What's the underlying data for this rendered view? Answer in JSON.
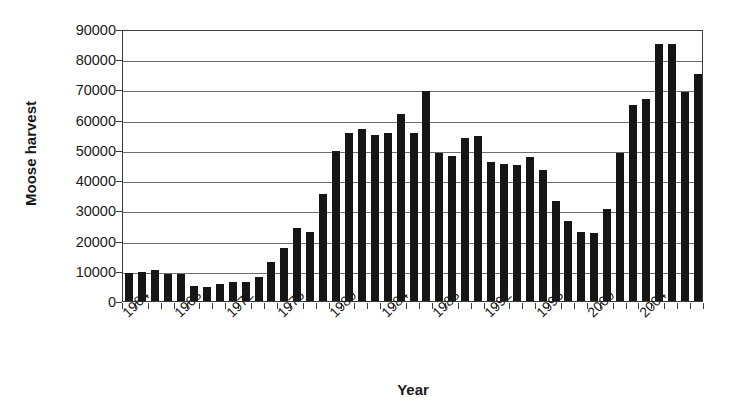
{
  "chart_data": {
    "type": "bar",
    "title": "",
    "xlabel": "Year",
    "ylabel": "Moose harvest",
    "ylim": [
      0,
      90000
    ],
    "ytick_labels": [
      "0",
      "10000",
      "20000",
      "30000",
      "40000",
      "50000",
      "60000",
      "70000",
      "80000",
      "90000"
    ],
    "ytick_values": [
      0,
      10000,
      20000,
      30000,
      40000,
      50000,
      60000,
      70000,
      80000,
      90000
    ],
    "grid": true,
    "legend": "none",
    "xtick_labels": [
      "1964",
      "1968",
      "1972",
      "1976",
      "1980",
      "1984",
      "1988",
      "1992",
      "1996",
      "2000",
      "2004"
    ],
    "xtick_values": [
      1964,
      1968,
      1972,
      1976,
      1980,
      1984,
      1988,
      1992,
      1996,
      2000,
      2004
    ],
    "categories": [
      1963,
      1964,
      1965,
      1966,
      1967,
      1968,
      1969,
      1970,
      1971,
      1972,
      1973,
      1974,
      1975,
      1976,
      1977,
      1978,
      1979,
      1980,
      1981,
      1982,
      1983,
      1984,
      1985,
      1986,
      1987,
      1988,
      1989,
      1990,
      1991,
      1992,
      1993,
      1994,
      1995,
      1996,
      1997,
      1998,
      1999,
      2000,
      2001,
      2002,
      2003,
      2004,
      2005,
      2006,
      2007
    ],
    "values": [
      9200,
      9600,
      10200,
      9000,
      8900,
      5000,
      4500,
      5500,
      6200,
      6400,
      8000,
      12800,
      17700,
      24000,
      23000,
      35500,
      49500,
      55500,
      57000,
      55000,
      55500,
      62000,
      55500,
      69500,
      49000,
      48000,
      54000,
      54500,
      46000,
      45500,
      45000,
      47500,
      43500,
      33000,
      26500,
      23000,
      22500,
      30500,
      49000,
      65000,
      67000,
      85000,
      85000,
      69000,
      75000
    ]
  }
}
